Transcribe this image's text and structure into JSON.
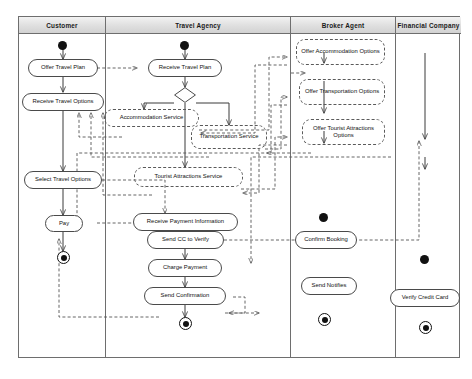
{
  "diagram": {
    "type": "uml-activity-diagram",
    "line_color": "#4a4a4a",
    "header_fill": "#e2e2e2"
  },
  "lanes": [
    {
      "id": "customer",
      "label": "Customer"
    },
    {
      "id": "agency",
      "label": "Travel Agency"
    },
    {
      "id": "broker",
      "label": "Broker Agent"
    },
    {
      "id": "financial",
      "label": "Financial Company"
    }
  ],
  "nodes": {
    "customer": {
      "offer_travel_plan": "Offer Travel Plan",
      "receive_travel_options": "Receive Travel Options",
      "select_travel_options": "Select Travel Options",
      "pay": "Pay"
    },
    "agency": {
      "receive_travel_plan": "Receive Travel Plan",
      "accommodation_service": "Accommodation Service",
      "transportation_service": "Transportation Service",
      "tourist_attractions_service": "Tourist Attractions Service",
      "receive_payment_information": "Receive Payment Information",
      "send_cc_to_verify": "Send CC to Verify",
      "charge_payment": "Charge Payment",
      "send_confirmation": "Send Confirmation"
    },
    "broker": {
      "offer_accommodation_options": "Offer Accommodation Options",
      "offer_transportation_options": "Offer Transportation Options",
      "offer_tourist_attractions_options": "Offer Tourist Attractions Options",
      "confirm_booking": "Confirm Booking",
      "send_notifies": "Send Notifies"
    },
    "financial": {
      "verify_credit_card": "Verify Credit Card"
    }
  },
  "control_nodes": {
    "initial_customer": "initial-node",
    "initial_agency": "initial-node",
    "initial_broker": "initial-node",
    "initial_financial": "initial-node",
    "final_customer": "final-node",
    "final_agency": "final-node",
    "final_broker": "final-node",
    "final_financial": "final-node",
    "decision_agency": "decision-diamond"
  }
}
